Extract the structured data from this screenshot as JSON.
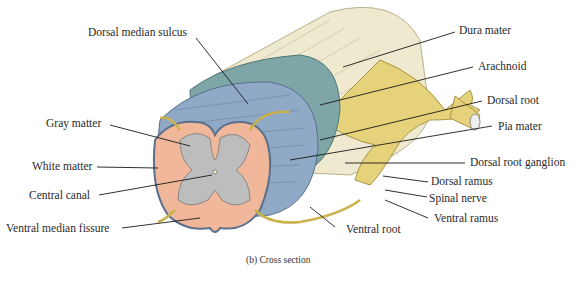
{
  "figure": {
    "caption": "(b) Cross section",
    "labels_left": {
      "dorsal_median_sulcus": "Dorsal median sulcus",
      "gray_matter": "Gray matter",
      "white_matter": "White matter",
      "central_canal": "Central canal",
      "ventral_median_fissure": "Ventral median fissure"
    },
    "labels_right": {
      "dura_mater": "Dura mater",
      "arachnoid": "Arachnoid",
      "dorsal_root": "Dorsal root",
      "pia_mater": "Pia mater",
      "dorsal_root_ganglion": "Dorsal root ganglion",
      "dorsal_ramus": "Dorsal ramus",
      "spinal_nerve": "Spinal nerve",
      "ventral_ramus": "Ventral ramus",
      "ventral_root": "Ventral root"
    },
    "colors": {
      "dura": "#efe9cf",
      "arachnoid": "#7fa6a6",
      "white_matter_surface": "#8fa9c6",
      "white_matter_section": "#f1b79b",
      "gray_matter": "#bdbdbd",
      "nerve": "#e6d27a",
      "leader_line": "#1a1a1a"
    }
  }
}
